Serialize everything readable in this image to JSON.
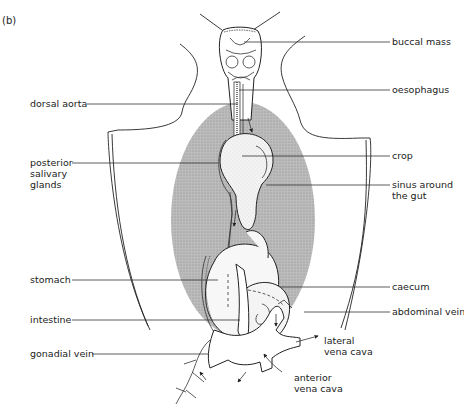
{
  "figure": {
    "panel_label": "(b)",
    "labels": {
      "buccal_mass": "buccal mass",
      "oesophagus": "oesophagus",
      "dorsal_aorta": "dorsal aorta",
      "crop": "crop",
      "posterior_salivary_glands": [
        "posterior",
        "salivary",
        "glands"
      ],
      "sinus_around_gut": [
        "sinus around",
        "the gut"
      ],
      "stomach": "stomach",
      "caecum": "caecum",
      "intestine": "intestine",
      "abdominal_vein": "abdominal vein",
      "gonadial_vein": "gonadial vein",
      "lateral_vena_cava": [
        "lateral",
        "vena cava"
      ],
      "anterior_vena_cava": [
        "anterior",
        "vena cava"
      ]
    },
    "colors": {
      "line": "#222222",
      "sinus_fill": "#bdbdbd",
      "organ_fill": "#ececec",
      "background": "#ffffff"
    }
  }
}
